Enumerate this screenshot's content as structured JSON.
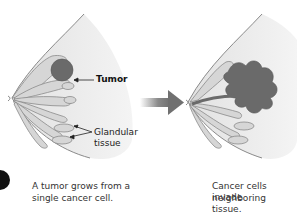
{
  "diagram": {
    "panels": [
      {
        "id": "left",
        "caption_line1": "A tumor grows from a",
        "caption_line2": "single cancer cell.",
        "labels": {
          "tumor": "Tumor",
          "glandular_line1": "Glandular",
          "glandular_line2": "tissue"
        }
      },
      {
        "id": "right",
        "caption_line1": "Cancer cells invade",
        "caption_line2": "neighboring tissue."
      }
    ],
    "arrow": "progression-arrow",
    "colors": {
      "skin_fill": "#e6e6e6",
      "outline": "#8a8a8a",
      "gland_fill": "#d6d6d6",
      "tumor_fill": "#6a6a6a",
      "arrow": "#707070",
      "marker": "#111111"
    }
  }
}
